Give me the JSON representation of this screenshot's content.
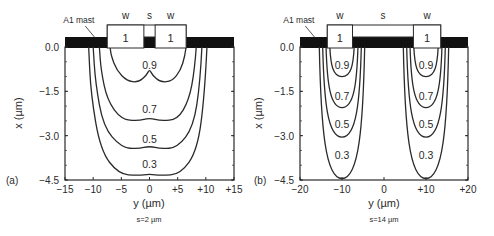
{
  "figure": {
    "background": "#ffffff",
    "ink": "#2a2a2a",
    "mask_color": "#111111"
  },
  "chart_data": [
    {
      "type": "contour",
      "panel_label": "(a)",
      "caption": "s=2 µm",
      "xlabel": "y (µm)",
      "ylabel": "x (µm)",
      "xlim": [
        -15,
        15
      ],
      "ylim": [
        -4.5,
        0.0
      ],
      "xticks": [
        -15,
        -10,
        -5,
        0,
        5,
        10,
        15
      ],
      "xtick_labels": [
        "−15",
        "−10",
        "−5",
        "0",
        "+5",
        "+10",
        "+15"
      ],
      "yticks": [
        0.0,
        -1.5,
        -3.0,
        -4.5
      ],
      "ytick_labels": [
        "0.0",
        "−1.5",
        "−3.0",
        "−4.5"
      ],
      "grid": false,
      "mask_label": "A1 mast",
      "electrodes": [
        {
          "label": "w",
          "value": "1",
          "y_from": -7.5,
          "y_to": -1.0
        },
        {
          "label": "s",
          "value": "",
          "y_from": -1.0,
          "y_to": 1.0
        },
        {
          "label": "w",
          "value": "1",
          "y_from": 1.0,
          "y_to": 6.5
        }
      ],
      "contours": [
        {
          "level": "0.9",
          "label_pos": [
            0,
            -0.6
          ],
          "points": [
            [
              6.5,
              0
            ],
            [
              6.3,
              -0.3
            ],
            [
              5.5,
              -0.8
            ],
            [
              4,
              -1.15
            ],
            [
              2,
              -1.2
            ],
            [
              0.5,
              -0.95
            ],
            [
              0,
              -0.75
            ],
            [
              -0.5,
              -0.95
            ],
            [
              -2,
              -1.2
            ],
            [
              -4,
              -1.15
            ],
            [
              -5.8,
              -0.8
            ],
            [
              -6.8,
              -0.3
            ],
            [
              -7,
              0
            ]
          ]
        },
        {
          "level": "0.7",
          "label_pos": [
            0,
            -2.1
          ],
          "points": [
            [
              8.3,
              0
            ],
            [
              8,
              -0.8
            ],
            [
              7,
              -1.8
            ],
            [
              5,
              -2.45
            ],
            [
              2,
              -2.5
            ],
            [
              0,
              -2.4
            ],
            [
              -2,
              -2.5
            ],
            [
              -5,
              -2.45
            ],
            [
              -7.5,
              -1.8
            ],
            [
              -8.6,
              -0.8
            ],
            [
              -8.9,
              0
            ]
          ]
        },
        {
          "level": "0.5",
          "label_pos": [
            0,
            -3.1
          ],
          "points": [
            [
              9.3,
              0
            ],
            [
              9,
              -1.2
            ],
            [
              7.8,
              -2.7
            ],
            [
              5,
              -3.4
            ],
            [
              2,
              -3.45
            ],
            [
              0,
              -3.35
            ],
            [
              -2,
              -3.45
            ],
            [
              -5,
              -3.4
            ],
            [
              -8.2,
              -2.7
            ],
            [
              -9.6,
              -1.2
            ],
            [
              -10,
              0
            ]
          ]
        },
        {
          "level": "0.3",
          "label_pos": [
            0,
            -3.95
          ],
          "points": [
            [
              10.2,
              0
            ],
            [
              9.8,
              -1.6
            ],
            [
              8.5,
              -3.5
            ],
            [
              5.5,
              -4.3
            ],
            [
              2,
              -4.35
            ],
            [
              0,
              -4.3
            ],
            [
              -2,
              -4.35
            ],
            [
              -5.5,
              -4.3
            ],
            [
              -8.7,
              -3.5
            ],
            [
              -10.4,
              -1.6
            ],
            [
              -10.8,
              0
            ]
          ]
        }
      ]
    },
    {
      "type": "contour",
      "panel_label": "(b)",
      "caption": "s=14 µm",
      "xlabel": "y (µm)",
      "ylabel": "x (µm)",
      "xlim": [
        -20,
        20
      ],
      "ylim": [
        -4.5,
        0.0
      ],
      "xticks": [
        -20,
        -10,
        0,
        10,
        20
      ],
      "xtick_labels": [
        "−20",
        "−10",
        "0",
        "+10",
        "+20"
      ],
      "yticks": [
        0.0,
        -1.5,
        -3.0,
        -4.5
      ],
      "ytick_labels": [
        "0.0",
        "−1.5",
        "−3.0",
        "−4.5"
      ],
      "grid": false,
      "mask_label": "A1 mast",
      "electrodes": [
        {
          "label": "w",
          "value": "1",
          "y_from": -13.5,
          "y_to": -7.5
        },
        {
          "label": "s",
          "value": "",
          "y_from": -7.5,
          "y_to": 7.0
        },
        {
          "label": "w",
          "value": "1",
          "y_from": 7.0,
          "y_to": 13.5
        }
      ],
      "contours": [
        {
          "level": "0.9",
          "center": -10,
          "half_width": 2.9,
          "depth": -1.0,
          "label_pos": [
            -10,
            -0.6
          ]
        },
        {
          "level": "0.7",
          "center": -10,
          "half_width": 3.8,
          "depth": -2.05,
          "label_pos": [
            -10,
            -1.65
          ]
        },
        {
          "level": "0.5",
          "center": -10,
          "half_width": 4.6,
          "depth": -3.05,
          "label_pos": [
            -10,
            -2.6
          ]
        },
        {
          "level": "0.3",
          "center": -10,
          "half_width": 5.4,
          "depth": -4.45,
          "label_pos": [
            -10,
            -3.65
          ]
        },
        {
          "level": "0.9",
          "center": 10,
          "half_width": 2.9,
          "depth": -1.0,
          "label_pos": [
            10,
            -0.6
          ]
        },
        {
          "level": "0.7",
          "center": 10,
          "half_width": 3.8,
          "depth": -2.05,
          "label_pos": [
            10,
            -1.65
          ]
        },
        {
          "level": "0.5",
          "center": 10,
          "half_width": 4.6,
          "depth": -3.05,
          "label_pos": [
            10,
            -2.6
          ]
        },
        {
          "level": "0.3",
          "center": 10,
          "half_width": 5.4,
          "depth": -4.45,
          "label_pos": [
            10,
            -3.65
          ]
        }
      ]
    }
  ]
}
